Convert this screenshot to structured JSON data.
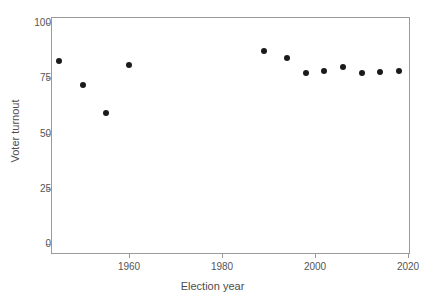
{
  "chart_data": {
    "type": "scatter",
    "title": "",
    "xlabel": "Election year",
    "ylabel": "Voter turnout",
    "xlim": [
      1942,
      2021
    ],
    "ylim": [
      0,
      107
    ],
    "grid": false,
    "legend": false,
    "x_ticks": [
      1960,
      1980,
      2000,
      2020
    ],
    "x_tick_labels": [
      "1960",
      "1980",
      "2000",
      "2020"
    ],
    "y_ticks": [
      0,
      25,
      50,
      75,
      100
    ],
    "y_tick_labels": [
      "0",
      "25",
      "50",
      "75",
      "100"
    ],
    "marker": "filled-circle",
    "marker_color": "#1a1a1a",
    "series": [
      {
        "name": "Voter turnout",
        "points": [
          {
            "x": 1945,
            "y": 83.0
          },
          {
            "x": 1950,
            "y": 72.0
          },
          {
            "x": 1955,
            "y": 59.5
          },
          {
            "x": 1960,
            "y": 81.0
          },
          {
            "x": 1989,
            "y": 87.5
          },
          {
            "x": 1994,
            "y": 84.0
          },
          {
            "x": 1998,
            "y": 77.5
          },
          {
            "x": 2002,
            "y": 78.5
          },
          {
            "x": 2006,
            "y": 80.0
          },
          {
            "x": 2010,
            "y": 77.5
          },
          {
            "x": 2014,
            "y": 78.0
          },
          {
            "x": 2018,
            "y": 78.5
          }
        ]
      }
    ]
  },
  "style": {
    "axis_color": "#9a9a9a",
    "text_color": "#4d4d4d",
    "background": "#ffffff"
  }
}
